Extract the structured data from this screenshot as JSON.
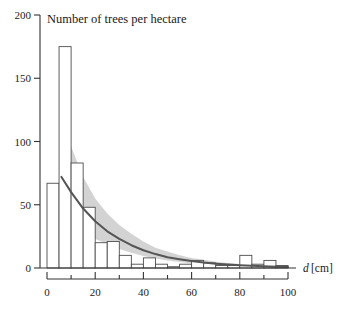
{
  "chart_data": {
    "type": "bar",
    "title": "Number of trees per hectare",
    "xlabel_var": "d",
    "xlabel_unit": "[cm]",
    "ylabel": "",
    "xlim": [
      0,
      102
    ],
    "ylim": [
      0,
      200
    ],
    "grid": false,
    "legend": "none",
    "bin_width": 5,
    "x_ticks": [
      0,
      20,
      40,
      60,
      80,
      100
    ],
    "x_tick_labels": [
      "0",
      "20",
      "40",
      "60",
      "80",
      "100"
    ],
    "x_minor_ticks": [
      0,
      10,
      20,
      30,
      40,
      50,
      60,
      70,
      80,
      90,
      100
    ],
    "y_ticks": [
      0,
      50,
      100,
      150,
      200
    ],
    "y_tick_labels": [
      "0",
      "50",
      "100",
      "150",
      "200"
    ],
    "categories": [
      "0-5",
      "5-10",
      "10-15",
      "15-20",
      "20-25",
      "25-30",
      "30-35",
      "35-40",
      "40-45",
      "45-50",
      "50-55",
      "55-60",
      "60-65",
      "65-70",
      "70-75",
      "75-80",
      "80-85",
      "85-90",
      "90-95",
      "95-100"
    ],
    "bin_edges": [
      0,
      5,
      10,
      15,
      20,
      25,
      30,
      35,
      40,
      45,
      50,
      55,
      60,
      65,
      70,
      75,
      80,
      85,
      90,
      95,
      100
    ],
    "values": [
      67,
      175,
      83,
      48,
      20,
      21,
      10,
      3,
      8,
      3,
      1,
      3,
      6,
      4,
      2,
      2,
      10,
      3,
      6,
      2
    ],
    "series": [
      {
        "name": "Observed trees per hectare",
        "type": "bar",
        "values": [
          67,
          175,
          83,
          48,
          20,
          21,
          10,
          3,
          8,
          3,
          1,
          3,
          6,
          4,
          2,
          2,
          10,
          3,
          6,
          2
        ]
      },
      {
        "name": "Fitted exponential model",
        "type": "line",
        "x": [
          6,
          10,
          15,
          20,
          25,
          30,
          35,
          40,
          45,
          50,
          55,
          60,
          65,
          70,
          75,
          80,
          85,
          90,
          95,
          100
        ],
        "y": [
          72,
          60,
          47,
          37,
          29,
          23,
          18,
          14,
          11,
          8.5,
          7,
          5.5,
          4.3,
          3.4,
          2.7,
          2.1,
          1.7,
          1.3,
          1.0,
          0.8
        ]
      },
      {
        "name": "Confidence band upper",
        "type": "area",
        "x": [
          6,
          10,
          15,
          20,
          25,
          30,
          35,
          40,
          45,
          50,
          55,
          60,
          65,
          70,
          75,
          80,
          85,
          90,
          95,
          100
        ],
        "y": [
          122,
          96,
          72,
          55,
          43,
          34,
          27,
          21,
          16,
          13,
          10,
          8,
          6.5,
          5,
          4,
          3.2,
          2.6,
          2.1,
          1.7,
          1.4
        ]
      },
      {
        "name": "Confidence band lower",
        "type": "area",
        "x": [
          6,
          10,
          15,
          20,
          25,
          30,
          35,
          40,
          45,
          50,
          55,
          60,
          65,
          70,
          75,
          80,
          85,
          90,
          95,
          100
        ],
        "y": [
          34,
          31,
          27,
          23,
          19,
          15,
          12,
          9.5,
          7.5,
          6,
          4.8,
          3.8,
          3.0,
          2.4,
          1.9,
          1.5,
          1.2,
          0.9,
          0.7,
          0.5
        ]
      }
    ],
    "colors": {
      "bar_stroke": "#4d4d4d",
      "bar_fill": "#ffffff",
      "curve": "#555555",
      "band": "#cccccc",
      "axis": "#333333"
    }
  }
}
